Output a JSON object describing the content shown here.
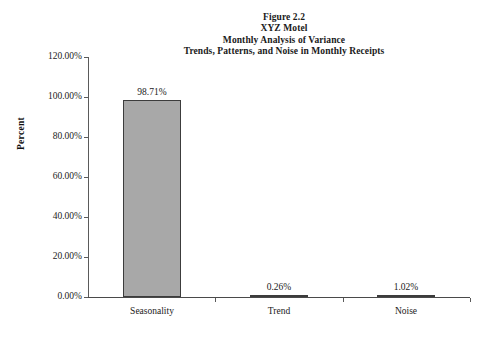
{
  "chart_data": {
    "type": "bar",
    "title": "Figure 2.2\nXYZ Motel\nMonthly Analysis of Variance\nTrends, Patterns, and Noise in Monthly Receipts",
    "title_lines": [
      "Figure 2.2",
      "XYZ Motel",
      "Monthly Analysis of Variance",
      "Trends, Patterns, and Noise in Monthly Receipts"
    ],
    "categories": [
      "Seasonality",
      "Trend",
      "Noise"
    ],
    "values": [
      98.71,
      0.26,
      1.02
    ],
    "value_labels": [
      "98.71%",
      "0.26%",
      "1.02%"
    ],
    "xlabel": "",
    "ylabel": "Percent",
    "ylim": [
      0,
      120
    ],
    "ytick_values": [
      0,
      20,
      40,
      60,
      80,
      100,
      120
    ],
    "ytick_labels": [
      "0.00%",
      "20.00%",
      "40.00%",
      "60.00%",
      "80.00%",
      "100.00%",
      "120.00%"
    ],
    "grid": false,
    "legend": false,
    "bar_fill_color": "#a8a8a8",
    "bar_border_color": "#3c3c3c",
    "axis_color": "#5a5a5a",
    "background_color": "#ffffff"
  }
}
